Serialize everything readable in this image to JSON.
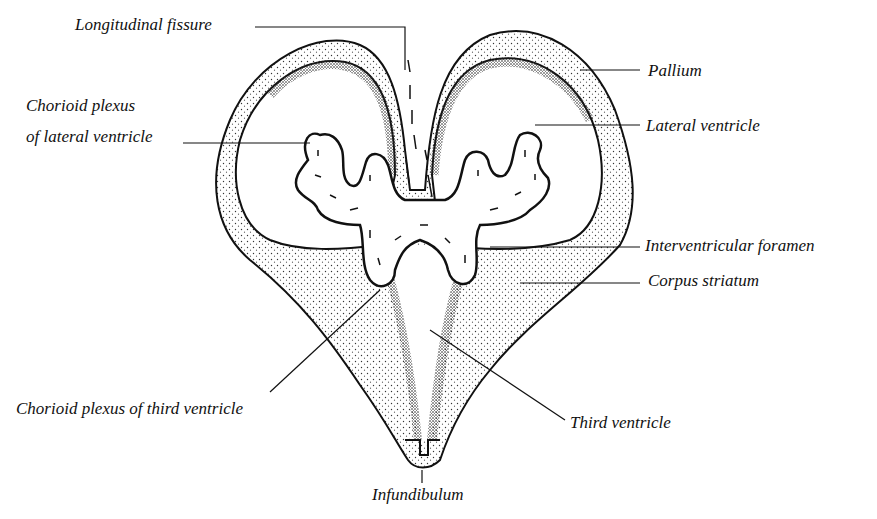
{
  "diagram": {
    "labels": [
      {
        "id": "longitudinal-fissure",
        "text": "Longitudinal fissure",
        "x": 75,
        "y": 15
      },
      {
        "id": "pallium",
        "text": "Pallium",
        "x": 652,
        "y": 62
      },
      {
        "id": "lateral-ventricle",
        "text": "Lateral ventricle",
        "x": 648,
        "y": 117
      },
      {
        "id": "chorioid-plexus-lateral-1",
        "text": "Chorioid plexus",
        "x": 26,
        "y": 97
      },
      {
        "id": "chorioid-plexus-lateral-2",
        "text": "of lateral ventricle",
        "x": 26,
        "y": 128
      },
      {
        "id": "interventricular-foramen",
        "text": "Interventricular foramen",
        "x": 645,
        "y": 235
      },
      {
        "id": "corpus-striatum",
        "text": "Corpus striatum",
        "x": 648,
        "y": 271
      },
      {
        "id": "chorioid-plexus-third",
        "text": "Chorioid plexus of third ventricle",
        "x": 16,
        "y": 400
      },
      {
        "id": "third-ventricle",
        "text": "Third ventricle",
        "x": 570,
        "y": 414
      },
      {
        "id": "infundibulum",
        "text": "Infundibulum",
        "x": 370,
        "y": 485
      }
    ],
    "colors": {
      "ink": "#111111",
      "paper": "#ffffff"
    }
  }
}
